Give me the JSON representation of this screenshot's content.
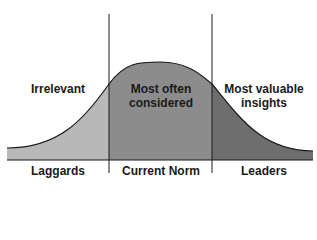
{
  "diagram": {
    "type": "bell-curve-segments",
    "colors": {
      "left": "#b8b8b8",
      "middle": "#8c8c8c",
      "right": "#6e6e6e",
      "line": "#1a1a1a"
    },
    "regions": [
      {
        "top_label": "Irrelevant",
        "bottom_label": "Laggards"
      },
      {
        "top_label": "Most often considered",
        "bottom_label": "Current Norm"
      },
      {
        "top_label": "Most valuable insights",
        "bottom_label": "Leaders"
      }
    ]
  }
}
